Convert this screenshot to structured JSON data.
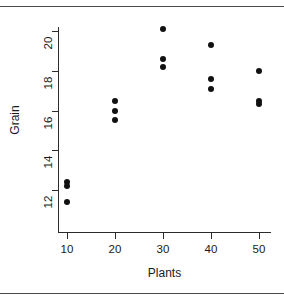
{
  "chart_data": {
    "type": "scatter",
    "title": "",
    "xlabel": "Plants",
    "ylabel": "Grain",
    "xlim": [
      5,
      55
    ],
    "ylim": [
      11.0,
      20.6
    ],
    "grid": false,
    "legend": null,
    "xticks": [
      10,
      20,
      30,
      40,
      50
    ],
    "xtick_labels": [
      "10",
      "20",
      "30",
      "40",
      "50"
    ],
    "yticks": [
      12,
      14,
      16,
      18,
      20
    ],
    "ytick_labels": [
      "12",
      "14",
      "16",
      "18",
      "20"
    ],
    "marker": "filled-circle",
    "marker_color": "#111111",
    "points": [
      {
        "x": 10,
        "y": 12.4
      },
      {
        "x": 10,
        "y": 12.2
      },
      {
        "x": 10,
        "y": 11.4
      },
      {
        "x": 20,
        "y": 16.5
      },
      {
        "x": 20,
        "y": 16.0
      },
      {
        "x": 20,
        "y": 15.5
      },
      {
        "x": 30,
        "y": 20.1
      },
      {
        "x": 30,
        "y": 18.6
      },
      {
        "x": 30,
        "y": 18.2
      },
      {
        "x": 40,
        "y": 19.3
      },
      {
        "x": 40,
        "y": 17.6
      },
      {
        "x": 40,
        "y": 17.1
      },
      {
        "x": 50,
        "y": 18.0
      },
      {
        "x": 50,
        "y": 16.5
      },
      {
        "x": 50,
        "y": 16.35
      }
    ]
  },
  "figure": {
    "background_color": "#ffffff",
    "axis_color": "#2b2b2b",
    "text_color": "#1a1a1a"
  }
}
